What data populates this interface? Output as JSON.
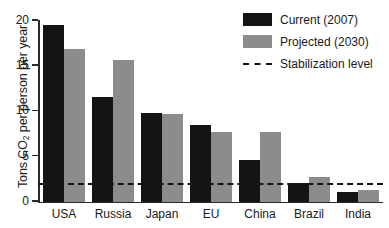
{
  "chart_data": {
    "type": "bar",
    "title": "",
    "xlabel": "",
    "ylabel": "Tons CO2 per person per year",
    "ylabel_prefix": "Tons CO",
    "ylabel_sub": "2",
    "ylabel_suffix": " per person per year",
    "categories": [
      "USA",
      "Russia",
      "Japan",
      "EU",
      "China",
      "Brazil",
      "India"
    ],
    "series": [
      {
        "name": "Current (2007)",
        "color": "#141414",
        "values": [
          19.5,
          11.5,
          9.8,
          8.5,
          4.6,
          2.1,
          1.1
        ]
      },
      {
        "name": "Projected (2030)",
        "color": "#8c8c8c",
        "values": [
          16.8,
          15.6,
          9.7,
          7.7,
          7.7,
          2.7,
          1.3
        ]
      }
    ],
    "reference_line": {
      "name": "Stabilization level",
      "value": 1.8,
      "style": "dashed",
      "color": "#151515"
    },
    "ylim": [
      0,
      20
    ],
    "yticks": [
      0,
      5,
      10,
      15,
      20
    ],
    "ytick_labels": [
      "0",
      "5",
      "10",
      "15",
      "20"
    ],
    "grid": false,
    "legend_position": "top-right"
  },
  "legend": {
    "entries": [
      {
        "label": "Current (2007)",
        "swatch": "current"
      },
      {
        "label": "Projected (2030)",
        "swatch": "projected"
      },
      {
        "label": "Stabilization level",
        "swatch": "dashline"
      }
    ]
  }
}
